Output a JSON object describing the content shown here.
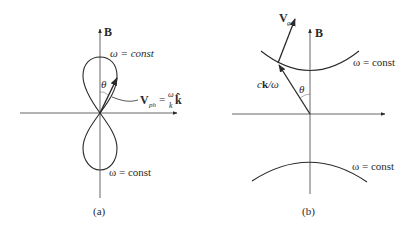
{
  "panels": [
    {
      "id": "a",
      "caption": "(a)",
      "axis_label": "B",
      "curve_labels": {
        "upper": "ω = const",
        "lower": "ω = const"
      },
      "angle_label": "θ",
      "vector_label": {
        "main": "V",
        "subscript": "ph",
        "equals": "=",
        "frac_num": "ω",
        "frac_den": "k",
        "unit": "k̂"
      },
      "shape": "figure-eight lobes along B"
    },
    {
      "id": "b",
      "caption": "(b)",
      "axis_label": "B",
      "curve_labels": {
        "upper": "ω = const",
        "lower": "ω = const"
      },
      "angle_label": "θ",
      "vector_labels": {
        "group_velocity_main": "V",
        "group_velocity_sub": "g",
        "wave_vector": "ck/ω",
        "wave_vector_c": "c",
        "wave_vector_k": "k",
        "wave_vector_rest": "/ω"
      },
      "shape": "hyperbola-like curves above and below"
    }
  ],
  "colors": {
    "line": "#2a2a2a",
    "axis": "#555555",
    "background": "#ffffff"
  }
}
